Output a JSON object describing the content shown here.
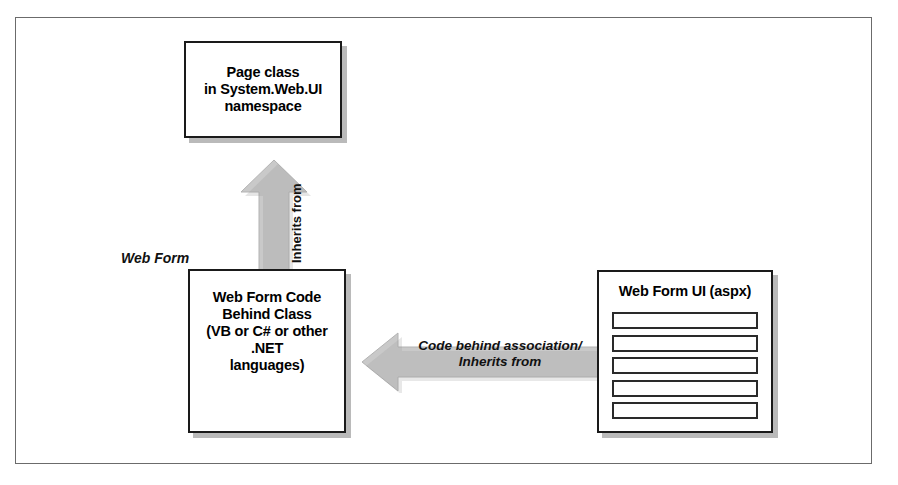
{
  "figure": {
    "background_color": "#ffffff",
    "border_color": "#6b6b6b"
  },
  "nodes": {
    "page_class": {
      "label": "Page class\nin System.Web.UI\nnamespace"
    },
    "code_behind": {
      "label": "Web Form Code\nBehind Class\n(VB or C# or other .NET\nlanguages)"
    },
    "web_form_ui": {
      "label": "Web Form UI (aspx)",
      "rows": [
        "",
        "",
        "",
        "",
        ""
      ]
    }
  },
  "labels": {
    "web_form_group": "Web Form"
  },
  "arrows": {
    "inherits_up": {
      "label": "Inherits from",
      "direction": "up",
      "color": "#c9c9c9"
    },
    "code_behind_assoc": {
      "label": "Code behind association/\nInherits from",
      "direction": "left",
      "color": "#c9c9c9"
    }
  }
}
